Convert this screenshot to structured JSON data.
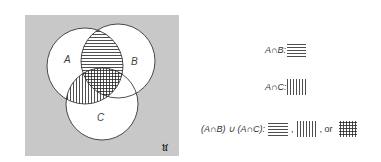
{
  "diagram": {
    "universe_label": "𝔘",
    "sets": [
      {
        "name": "A",
        "label": "A"
      },
      {
        "name": "B",
        "label": "B"
      },
      {
        "name": "C",
        "label": "C"
      }
    ],
    "colors": {
      "universe": "#c8c8c8",
      "circle_fill": "#ffffff",
      "stroke": "#222222"
    }
  },
  "legend": {
    "a_and_b": {
      "label": "A∩B:",
      "pattern": "horizontal-lines"
    },
    "a_and_c": {
      "label": "A∩C:",
      "pattern": "vertical-lines"
    },
    "union": {
      "label": "(A∩B) ∪ (A∩C):",
      "sep1": ",",
      "sep2": ", or",
      "patterns": [
        "horizontal-lines",
        "vertical-lines",
        "crosshatch"
      ]
    }
  }
}
